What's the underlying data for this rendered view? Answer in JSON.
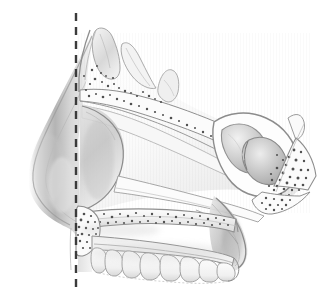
{
  "figure": {
    "kind": "anatomical-illustration",
    "title": "Sagittal section of the nasal cavity and nasal septum",
    "style": "grayscale pencil / stipple medical drawing",
    "background_color": "#ffffff",
    "width_px": 329,
    "height_px": 308,
    "visible_text": []
  },
  "palette": {
    "background": "#ffffff",
    "outline_dark": "#5a5a5a",
    "outline_mid": "#8d8d8d",
    "outline_light": "#b6b6b6",
    "shade_deep": "#9a9a9a",
    "shade_mid": "#c2c2c2",
    "shade_pale": "#e2e2e2",
    "bone_fill": "#fbfbfb",
    "stipple": "#4f4f4f",
    "dashed_line": "#3b3b3b"
  },
  "reference_line": {
    "name": "vertical-dashed-reference-line",
    "orientation": "vertical",
    "x_px": 76,
    "y_start_px": 13,
    "y_end_px": 292,
    "color": "#3b3b3b",
    "stroke_width_px": 2.4,
    "dash_length_px": 8,
    "gap_length_px": 6
  },
  "structures": [
    {
      "id": "nasal-dorsum-soft-tissue",
      "label": "External nose soft tissue (dorsum and tip)",
      "region": "left"
    },
    {
      "id": "frontal-sinus",
      "label": "Frontal sinus",
      "region": "upper-left"
    },
    {
      "id": "nasal-bone",
      "label": "Nasal bone",
      "region": "upper-left"
    },
    {
      "id": "cribriform-plate",
      "label": "Cribriform plate of ethmoid",
      "region": "upper-center"
    },
    {
      "id": "crista-galli-bump",
      "label": "Crista galli / ethmoid crest",
      "region": "upper-center-right"
    },
    {
      "id": "perpendicular-plate-ethmoid",
      "label": "Perpendicular plate of the ethmoid",
      "region": "center"
    },
    {
      "id": "septal-cartilage",
      "label": "Septal (quadrangular) cartilage",
      "region": "center-left"
    },
    {
      "id": "vomer",
      "label": "Vomer",
      "region": "center-right"
    },
    {
      "id": "sphenoid-sinus",
      "label": "Sphenoid sinus",
      "region": "right"
    },
    {
      "id": "sphenoid-body-diploe",
      "label": "Sphenoid body with spongy bone",
      "region": "right"
    },
    {
      "id": "pterygoid-plate",
      "label": "Pterygoid process",
      "region": "lower-right"
    },
    {
      "id": "hard-palate",
      "label": "Hard palate (palatine process of maxilla)",
      "region": "lower-center"
    },
    {
      "id": "anterior-nasal-spine",
      "label": "Anterior nasal spine",
      "region": "lower-left"
    },
    {
      "id": "soft-palate",
      "label": "Soft palate / posterior nasal aperture",
      "region": "lower-right"
    },
    {
      "id": "maxillary-teeth",
      "label": "Maxillary dental arch",
      "region": "bottom"
    }
  ],
  "teeth": {
    "count": 8,
    "arch": "maxillary",
    "view": "lateral profile"
  },
  "stipple_fields": [
    {
      "id": "frontal-sinus-diploe",
      "dot_count": 34
    },
    {
      "id": "cribriform-diploe",
      "dot_count": 26
    },
    {
      "id": "anterior-spine-diploe",
      "dot_count": 30
    },
    {
      "id": "hard-palate-diploe",
      "dot_count": 40
    },
    {
      "id": "sphenoid-diploe",
      "dot_count": 46
    },
    {
      "id": "pterygoid-diploe",
      "dot_count": 22
    }
  ]
}
